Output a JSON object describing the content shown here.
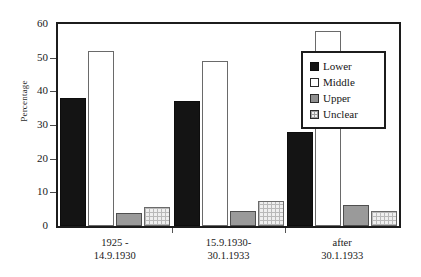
{
  "chart_data": {
    "type": "bar",
    "title": "",
    "xlabel": "",
    "ylabel": "Percentage",
    "ylim": [
      0,
      60
    ],
    "yticks": [
      0,
      10,
      20,
      30,
      40,
      50,
      60
    ],
    "grid": false,
    "legend_position": "upper-right-inside",
    "categories": [
      "1925 -\n14.9.1930",
      "15.9.1930-\n30.1.1933",
      "after\n30.1.1933"
    ],
    "category_lines": [
      [
        "1925 -",
        "14.9.1930"
      ],
      [
        "15.9.1930-",
        "30.1.1933"
      ],
      [
        "after",
        "30.1.1933"
      ]
    ],
    "series": [
      {
        "name": "Lower",
        "values": [
          38,
          37,
          28
        ],
        "color": "#141414",
        "pattern": "solid-black"
      },
      {
        "name": "Middle",
        "values": [
          52,
          49,
          58
        ],
        "color": "#ffffff",
        "pattern": "open-white"
      },
      {
        "name": "Upper",
        "values": [
          3.8,
          4.5,
          6.2
        ],
        "color": "#9a9a9a",
        "pattern": "solid-gray"
      },
      {
        "name": "Unclear",
        "values": [
          5.7,
          7.3,
          4.5
        ],
        "color": "#efefef",
        "pattern": "checkered"
      }
    ]
  },
  "axis": {
    "y_title": "Percentage",
    "y_tick_labels": [
      "60",
      "50",
      "40",
      "30",
      "20",
      "10",
      "0"
    ]
  },
  "legend": {
    "items": [
      {
        "label": "Lower"
      },
      {
        "label": "Middle"
      },
      {
        "label": "Upper"
      },
      {
        "label": "Unclear"
      }
    ]
  }
}
